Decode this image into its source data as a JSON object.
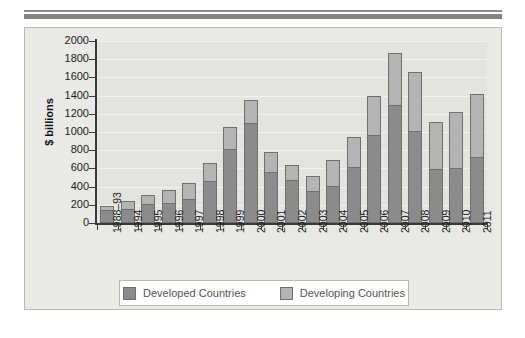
{
  "figure": {
    "background_color": "#e9e9e6",
    "plot_background_color": "#e3e3e0",
    "border_color": "#b9b9b6"
  },
  "legend": {
    "position": "bottom-center",
    "entries": [
      {
        "label": "Developed Countries",
        "color": "#8b8b8b",
        "icon": "color-swatch"
      },
      {
        "label": "Developing Countries",
        "color": "#b4b4b4",
        "icon": "color-swatch"
      }
    ]
  },
  "chart_data": {
    "type": "bar",
    "stacked": true,
    "title": "",
    "subtitle": "",
    "xlabel": "",
    "ylabel": "$ billions",
    "ylim": [
      0,
      2000
    ],
    "yticks": [
      0,
      200,
      400,
      600,
      800,
      1000,
      1200,
      1400,
      1600,
      1800,
      2000
    ],
    "ytick_labels": [
      "0",
      "200",
      "400",
      "600",
      "800",
      "1000",
      "1200",
      "1400",
      "1600",
      "1800",
      "2000"
    ],
    "grid": true,
    "grid_axis": "y",
    "legend_position": "bottom",
    "categories": [
      "1988–93",
      "1994",
      "1995",
      "1996",
      "1997",
      "1998",
      "1999",
      "2000",
      "2001",
      "2002",
      "2003",
      "2004",
      "2005",
      "2006",
      "2007",
      "2008",
      "2009",
      "2010",
      "2011"
    ],
    "series": [
      {
        "name": "Developed Countries",
        "color": "#8b8b8b",
        "values": [
          140,
          150,
          205,
          215,
          265,
          460,
          815,
          1100,
          565,
          470,
          350,
          410,
          615,
          970,
          1300,
          1010,
          590,
          605,
          730
        ]
      },
      {
        "name": "Developing Countries",
        "color": "#b4b4b4",
        "values": [
          45,
          95,
          105,
          150,
          180,
          195,
          235,
          255,
          220,
          170,
          170,
          280,
          325,
          425,
          565,
          650,
          525,
          620,
          685
        ]
      }
    ],
    "totals": [
      185,
      245,
      310,
      365,
      445,
      655,
      1050,
      1355,
      785,
      640,
      520,
      690,
      940,
      1395,
      1865,
      1660,
      1115,
      1225,
      1415
    ]
  }
}
